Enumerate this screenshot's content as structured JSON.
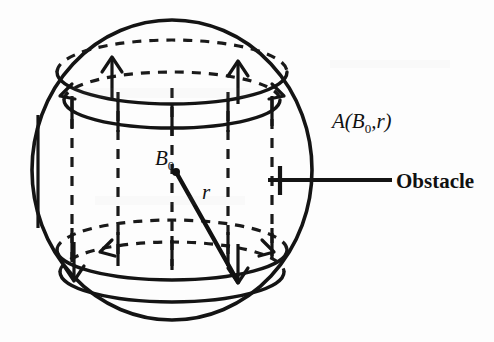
{
  "figure": {
    "background_color": "#fdfdfd",
    "ink_color": "#141414",
    "labels": {
      "region_label_a": "A(",
      "region_label_b": "B",
      "region_label_b_sub": "0",
      "region_label_comma": ",",
      "region_label_r": "r",
      "region_label_close": ")",
      "center_label": "B",
      "center_label_sub": "0",
      "radius_label": "r",
      "obstacle_label": "Obstacle"
    },
    "geometry": {
      "sphere": {
        "cx": 172,
        "cy": 170,
        "rx": 140,
        "ry": 150
      },
      "top_ellipse_outer": {
        "cx": 172,
        "cy": 72,
        "rx": 115,
        "ry": 32
      },
      "top_ellipse_inner": {
        "cx": 172,
        "cy": 100,
        "rx": 108,
        "ry": 28
      },
      "bottom_ellipse_outer": {
        "cx": 172,
        "cy": 250,
        "rx": 115,
        "ry": 30
      },
      "bottom_ellipse_inner": {
        "cx": 172,
        "cy": 272,
        "rx": 112,
        "ry": 30
      },
      "center_point": {
        "x": 176,
        "y": 172
      },
      "radius_end": {
        "x": 238,
        "y": 282
      },
      "obstacle_tick": {
        "x": 280,
        "y": 180
      },
      "obstacle_leader_x1": 268,
      "obstacle_leader_x2": 392
    }
  }
}
